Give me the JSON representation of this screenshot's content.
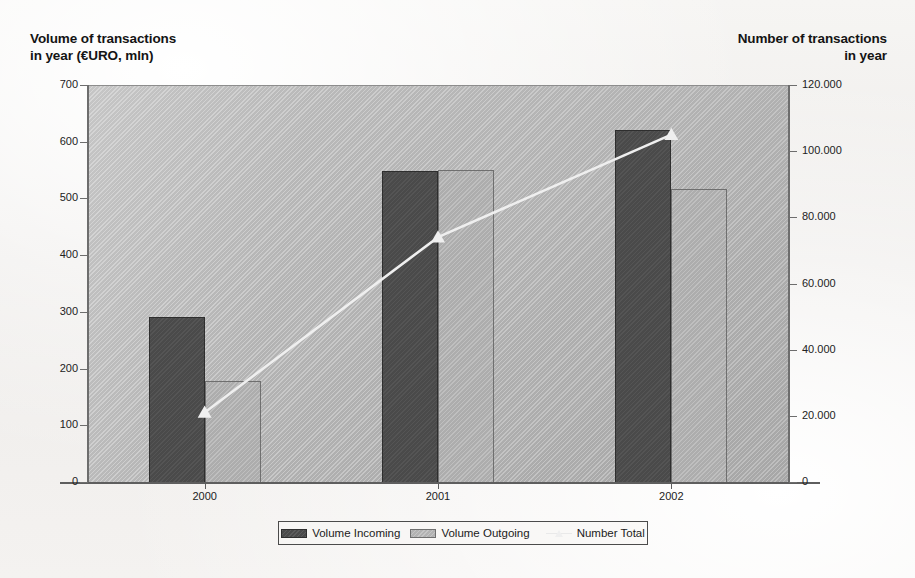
{
  "chart_data": {
    "type": "bar",
    "title": "",
    "subtitle": "",
    "categories": [
      "2000",
      "2001",
      "2002"
    ],
    "series": [
      {
        "name": "Volume Incoming",
        "axis": "left",
        "type": "bar",
        "color": "#4a4a4a",
        "values": [
          293,
          550,
          622
        ]
      },
      {
        "name": "Volume Outgoing",
        "axis": "left",
        "type": "bar",
        "color": "#adadad",
        "values": [
          180,
          552,
          518
        ]
      },
      {
        "name": "Number Total",
        "axis": "right",
        "type": "line",
        "color": "#efefef",
        "values": [
          21000,
          74000,
          105000
        ]
      }
    ],
    "left_axis": {
      "label": "Volume of transactions\nin year (€URO, mln)",
      "ylim": [
        0,
        700
      ],
      "ticks": [
        0,
        100,
        200,
        300,
        400,
        500,
        600,
        700
      ],
      "tick_labels": [
        "0",
        "100",
        "200",
        "300",
        "400",
        "500",
        "600",
        "700"
      ]
    },
    "right_axis": {
      "label": "Number of transactions\nin year",
      "ylim": [
        0,
        120000
      ],
      "ticks": [
        0,
        20000,
        40000,
        60000,
        80000,
        100000,
        120000
      ],
      "tick_labels": [
        "0",
        "20.000",
        "40.000",
        "60.000",
        "80.000",
        "100.000",
        "120.000"
      ]
    },
    "xlabel": "",
    "grid": false,
    "legend_position": "bottom",
    "legend_entries": [
      "Volume Incoming",
      "Volume Outgoing",
      "Number Total"
    ],
    "plot_background": "#b4b4b4"
  },
  "axis_titles": {
    "left": "Volume of transactions\nin year (€URO, mln)",
    "right": "Number of transactions\nin year"
  },
  "legend": {
    "incoming": "Volume Incoming",
    "outgoing": "Volume Outgoing",
    "total": "Number Total"
  },
  "colors": {
    "incoming": "#4a4a4a",
    "outgoing": "#adadad",
    "line": "#efefef",
    "plot_bg": "#b4b4b4",
    "page_bg": "#f2f0ee"
  }
}
